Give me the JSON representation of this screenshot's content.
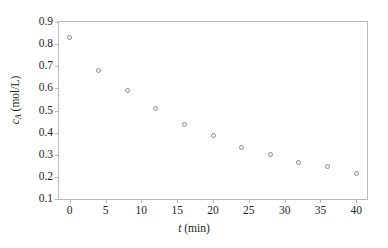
{
  "chart_data": {
    "type": "scatter",
    "title": "",
    "xlabel": "t (min)",
    "ylabel": "c_A (mol/L)",
    "xlabel_symbol": "t",
    "xlabel_units": "(min)",
    "ylabel_symbol": "c",
    "ylabel_subscript": "A",
    "ylabel_units": "(mol/L)",
    "x": [
      0,
      4,
      8,
      12,
      16,
      20,
      24,
      28,
      32,
      36,
      40
    ],
    "values": [
      0.83,
      0.68,
      0.59,
      0.51,
      0.435,
      0.385,
      0.335,
      0.303,
      0.265,
      0.247,
      0.215
    ],
    "xlim": [
      -1.5,
      41.5
    ],
    "ylim": [
      0.1,
      0.9
    ],
    "xticks": [
      0,
      5,
      10,
      15,
      20,
      25,
      30,
      35,
      40
    ],
    "yticks": [
      0.1,
      0.2,
      0.3,
      0.4,
      0.5,
      0.6,
      0.7,
      0.8,
      0.9
    ],
    "xtick_labels": [
      "0",
      "5",
      "10",
      "15",
      "20",
      "25",
      "30",
      "35",
      "40"
    ],
    "ytick_labels": [
      "0.1",
      "0.2",
      "0.3",
      "0.4",
      "0.5",
      "0.6",
      "0.7",
      "0.8",
      "0.9"
    ],
    "grid": false,
    "legend": false,
    "marker": "open-circle",
    "marker_color": "#8a8a8a",
    "frame_color": "#b9b9b9",
    "background": "#ffffff"
  }
}
